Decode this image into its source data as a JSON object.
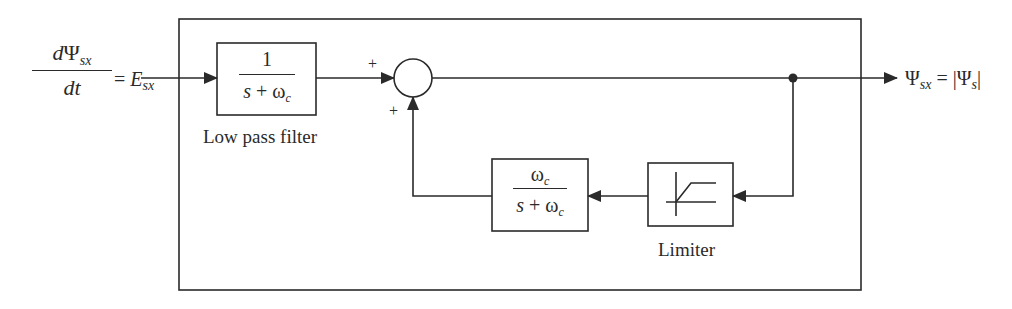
{
  "diagram": {
    "type": "block-diagram",
    "title": "",
    "input": {
      "numerator_d": "d",
      "numerator_psi": "Ψ",
      "numerator_sub": "sx",
      "denominator": "dt",
      "equals": "=",
      "rhs": "E",
      "rhs_sub": "sx"
    },
    "output": {
      "lhs": "Ψ",
      "lhs_sub": "sx",
      "equals": "=",
      "abs_open": "|",
      "rhs": "Ψ",
      "rhs_sub": "s",
      "abs_close": "|"
    },
    "blocks": [
      {
        "id": "low-pass-filter",
        "numerator": "1",
        "denominator_s": "s",
        "denominator_plus": "+",
        "denominator_w": "ω",
        "denominator_sub": "c",
        "label": "Low pass filter"
      },
      {
        "id": "feedback-filter",
        "numerator_w": "ω",
        "numerator_sub": "c",
        "denominator_s": "s",
        "denominator_plus": "+",
        "denominator_w": "ω",
        "denominator_sub": "c"
      },
      {
        "id": "limiter",
        "label": "Limiter",
        "icon": "saturation-icon"
      }
    ],
    "summing_junction": {
      "signs": [
        "+",
        "+"
      ]
    },
    "colors": {
      "stroke": "#2a2a2a",
      "background": "#ffffff"
    }
  }
}
